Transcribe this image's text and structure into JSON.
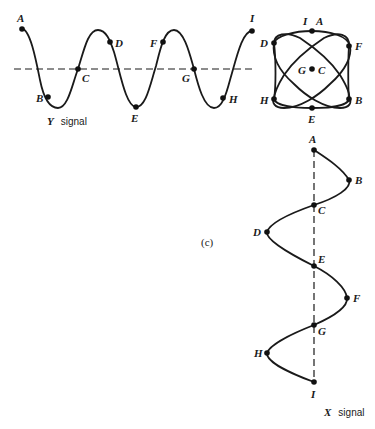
{
  "figure": {
    "panel_label": "(c)",
    "y_signal": {
      "caption_var": "Y",
      "caption_text": "signal",
      "points": [
        {
          "label": "A",
          "x": 22,
          "y": 29
        },
        {
          "label": "B",
          "x": 48,
          "y": 97
        },
        {
          "label": "C",
          "x": 78,
          "y": 69
        },
        {
          "label": "D",
          "x": 110,
          "y": 42
        },
        {
          "label": "E",
          "x": 136,
          "y": 107
        },
        {
          "label": "F",
          "x": 163,
          "y": 42
        },
        {
          "label": "G",
          "x": 194,
          "y": 69
        },
        {
          "label": "H",
          "x": 223,
          "y": 98
        },
        {
          "label": "I",
          "x": 252,
          "y": 31
        }
      ]
    },
    "lissajous": {
      "points": [
        {
          "label": "I",
          "x": 312,
          "y": 31
        },
        {
          "label": "A",
          "x": 312,
          "y": 31
        },
        {
          "label": "D",
          "x": 274,
          "y": 43
        },
        {
          "label": "F",
          "x": 349,
          "y": 46
        },
        {
          "label": "G",
          "x": 312,
          "y": 69
        },
        {
          "label": "C",
          "x": 312,
          "y": 69
        },
        {
          "label": "H",
          "x": 274,
          "y": 99
        },
        {
          "label": "B",
          "x": 349,
          "y": 99
        },
        {
          "label": "E",
          "x": 312,
          "y": 108
        }
      ]
    },
    "x_signal": {
      "caption_var": "X",
      "caption_text": "signal",
      "points": [
        {
          "label": "A",
          "x": 314,
          "y": 150
        },
        {
          "label": "B",
          "x": 349,
          "y": 180
        },
        {
          "label": "C",
          "x": 314,
          "y": 205
        },
        {
          "label": "D",
          "x": 267,
          "y": 232
        },
        {
          "label": "E",
          "x": 314,
          "y": 266
        },
        {
          "label": "F",
          "x": 347,
          "y": 298
        },
        {
          "label": "G",
          "x": 314,
          "y": 325
        },
        {
          "label": "H",
          "x": 267,
          "y": 353
        },
        {
          "label": "I",
          "x": 314,
          "y": 382
        }
      ]
    }
  }
}
